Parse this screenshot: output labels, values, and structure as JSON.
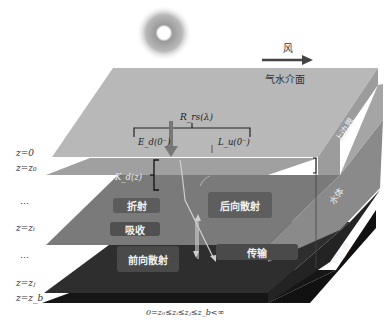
{
  "diagram": {
    "wind": {
      "label": "风",
      "direction": "right"
    },
    "surface_label": "气水介面",
    "radiance_labels": {
      "rrs": "R_rs(λ)",
      "ed": "E_d(0⁻)",
      "lu": "L_u(0⁻)",
      "kd": "K_d(z)"
    },
    "boundary_labels": {
      "upper": "上边界",
      "water": "水体",
      "lower": "下边界"
    },
    "processes": [
      {
        "id": "refraction",
        "label": "折射"
      },
      {
        "id": "backscatter",
        "label": "后向散射"
      },
      {
        "id": "absorption",
        "label": "吸收"
      },
      {
        "id": "forward_scatter",
        "label": "前向散射"
      },
      {
        "id": "transmission",
        "label": "传输"
      }
    ],
    "depth_labels": [
      {
        "label": "z=0"
      },
      {
        "label": "z=z₀"
      },
      {
        "label": "…"
      },
      {
        "label": "z=zᵢ"
      },
      {
        "label": "…"
      },
      {
        "label": "z=zⱼ"
      },
      {
        "label": "z=z_b"
      }
    ],
    "formula": "0=z₀≤zᵢ≤zⱼ≤z_b<∞",
    "colors": {
      "top_plane": "#b5b5b5",
      "second_plane": "#a3a3a3",
      "water_plane": "#7e7e7e",
      "deep_plane": "#3d3d3d",
      "bottom_plane": "#1e1e1e",
      "box_fill": "#5a5a5a"
    }
  }
}
